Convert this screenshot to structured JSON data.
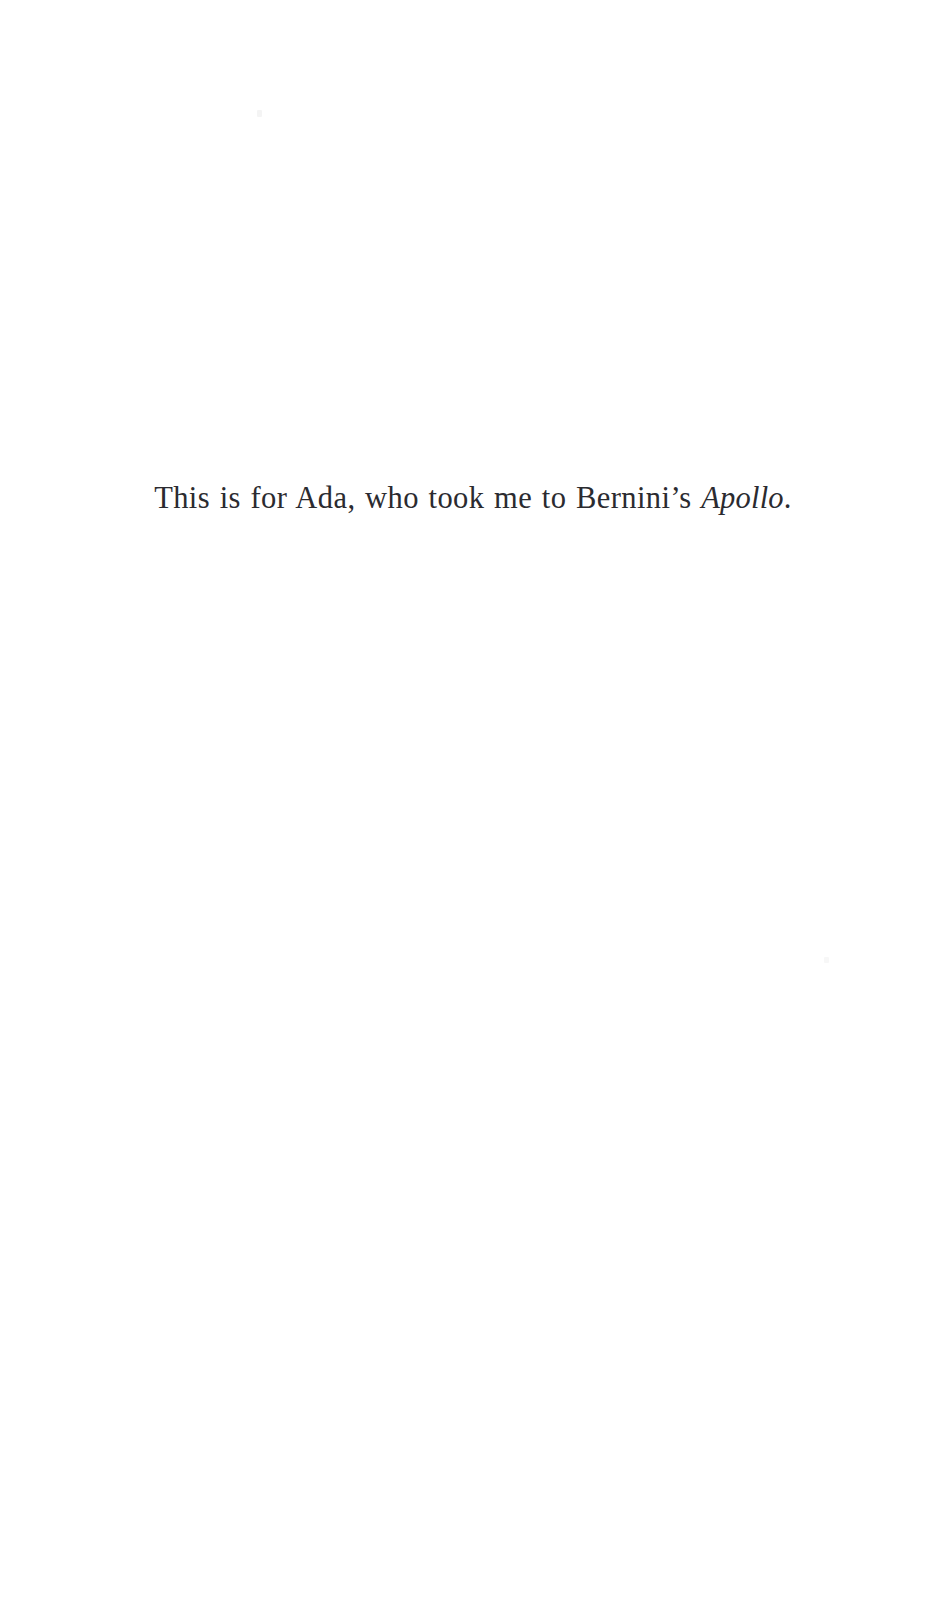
{
  "page": {
    "kind": "book-dedication-page",
    "background_color": "#ffffff",
    "text_color": "#2b2b30",
    "width": 946,
    "height": 1624
  },
  "dedication": {
    "full_text": "This is for Ada, who took me to Bernini's Apollo.",
    "lead_text": "This is for Ada, who took me to Bernini’s ",
    "work_title": "Apollo",
    "trailing_text": ".",
    "alignment": "center"
  },
  "artifacts": {
    "speck_upper_label": "scan-speck",
    "speck_lower_label": "scan-speck"
  }
}
